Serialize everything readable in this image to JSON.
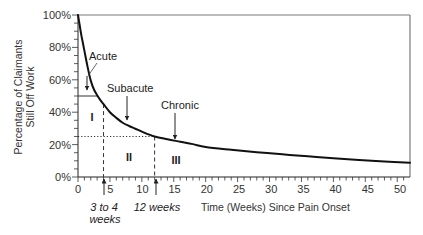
{
  "chart_data": {
    "type": "line",
    "title": "",
    "xlabel": "Time (Weeks) Since Pain Onset",
    "ylabel": "Percentage of Claimants Still Off Work",
    "ylabel_lines": [
      "Percentage of Claimants",
      "Still Off Work"
    ],
    "xlim": [
      0,
      52
    ],
    "ylim": [
      0,
      100
    ],
    "xticks": [
      0,
      5,
      10,
      15,
      20,
      25,
      30,
      35,
      40,
      45,
      50
    ],
    "xtick_labels": [
      "0",
      "5",
      "10",
      "15",
      "20",
      "25",
      "30",
      "35",
      "40",
      "45",
      "50"
    ],
    "yticks": [
      100,
      80,
      60,
      40,
      20,
      0
    ],
    "ytick_labels": [
      "100%",
      "80%",
      "60%",
      "40%",
      "20%",
      "0%"
    ],
    "x_minor_step": 1,
    "y_minor_step": 5,
    "grid": false,
    "legend": null,
    "series": [
      {
        "name": "Claimants still off work",
        "color": "#111111",
        "x": [
          0,
          0.25,
          0.5,
          0.75,
          1,
          1.5,
          2,
          2.5,
          3,
          3.5,
          4,
          5,
          6,
          7,
          8,
          9,
          10,
          12,
          14,
          16,
          18,
          20,
          24,
          28,
          32,
          36,
          40,
          44,
          48,
          52
        ],
        "y": [
          100,
          94,
          88,
          83,
          78,
          68,
          59.5,
          54,
          50.5,
          47.5,
          45,
          40,
          36.5,
          33.5,
          31.5,
          29.8,
          28,
          25,
          23.3,
          21.8,
          20.3,
          18.5,
          16.8,
          15.3,
          14,
          12.8,
          11.6,
          10.5,
          9.6,
          8.8
        ]
      }
    ],
    "reference_lines": [
      {
        "orientation": "horizontal",
        "y": 50,
        "x_from": 0,
        "x_to": 3.1,
        "style": "solid"
      },
      {
        "orientation": "horizontal",
        "y": 25,
        "x_from": 0,
        "x_to": 12,
        "style": "dotted"
      },
      {
        "orientation": "vertical",
        "x": 4,
        "y_from": 45,
        "y_to": 0,
        "style": "dashed"
      },
      {
        "orientation": "vertical",
        "x": 12,
        "y_from": 25,
        "y_to": 0,
        "style": "dashed"
      }
    ],
    "phases": [
      {
        "label": "Acute",
        "x": 1.4
      },
      {
        "label": "Subacute",
        "x": 7.5
      },
      {
        "label": "Chronic",
        "x": 15
      }
    ],
    "regions": [
      {
        "label": "I"
      },
      {
        "label": "II"
      },
      {
        "label": "III"
      }
    ],
    "markers": [
      {
        "label_line1": "3 to 4",
        "label_line2": "weeks",
        "x": 4
      },
      {
        "label_line1": "12 weeks",
        "x": 12
      }
    ]
  }
}
